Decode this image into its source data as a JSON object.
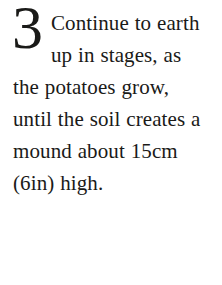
{
  "document": {
    "type": "instruction-step",
    "step_number": "3",
    "body_text": "Continue to earth up in stages, as the potatoes grow, until the soil creates a mound about 15cm (6in) high.",
    "rendered_lines": [
      "Continue to",
      "earth up in",
      "stages, as the",
      "potatoes grow,",
      "until the soil",
      "creates a mound",
      "about 15cm (6in)",
      "high."
    ],
    "measurements": [
      {
        "metric": "15cm",
        "imperial": "6in"
      }
    ]
  },
  "style": {
    "background_color": "#ffffff",
    "text_color": "#1a1a18"
  }
}
